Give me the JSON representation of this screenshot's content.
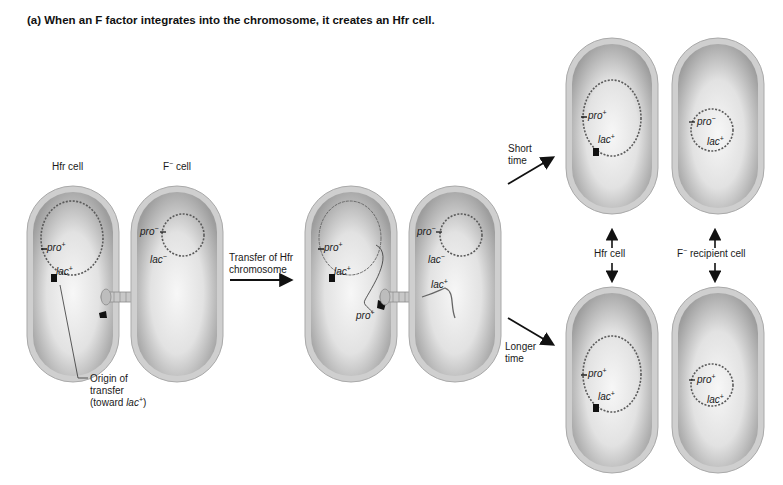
{
  "title": "(a) When an F factor integrates into the chromosome, it creates an Hfr cell.",
  "panel_left": {
    "hfr_label": "Hfr cell",
    "fminus_label": "F",
    "fminus_sup": "−",
    "fminus_suffix": " cell",
    "hfr_genes": {
      "pro": "pro",
      "pro_sup": "+",
      "lac": "lac",
      "lac_sup": "+"
    },
    "fminus_genes": {
      "pro": "pro",
      "pro_sup": "−",
      "lac": "lac",
      "lac_sup": "−"
    },
    "origin_label_line1": "Origin of",
    "origin_label_line2": "transfer",
    "origin_label_line3_prefix": "(toward ",
    "origin_label_line3_gene": "lac",
    "origin_label_line3_sup": "+",
    "origin_label_line3_suffix": ")"
  },
  "arrow_transfer": {
    "line1": "Transfer of Hfr",
    "line2": "chromosome"
  },
  "panel_middle": {
    "hfr_genes": {
      "pro": "pro",
      "pro_sup": "+",
      "lac": "lac",
      "lac_sup": "+",
      "pro2": "pro",
      "pro2_sup": "+"
    },
    "recipient_genes": {
      "pro": "pro",
      "pro_sup": "−",
      "lac": "lac",
      "lac_sup": "−",
      "lac2": "lac",
      "lac2_sup": "+"
    }
  },
  "branch_arrows": {
    "short": {
      "line1": "Short",
      "line2": "time"
    },
    "long": {
      "line1": "Longer",
      "line2": "time"
    }
  },
  "panel_right": {
    "hfr_cell_label": "Hfr cell",
    "recipient_label_prefix": "F",
    "recipient_label_sup": "−",
    "recipient_label_suffix": " recipient cell",
    "top_hfr_genes": {
      "pro": "pro",
      "pro_sup": "+",
      "lac": "lac",
      "lac_sup": "+"
    },
    "top_recipient_genes": {
      "pro": "pro",
      "pro_sup": "−",
      "lac": "lac",
      "lac_sup": "+"
    },
    "bottom_hfr_genes": {
      "pro": "pro",
      "pro_sup": "+",
      "lac": "lac",
      "lac_sup": "+"
    },
    "bottom_recipient_genes": {
      "pro": "pro",
      "pro_sup": "+",
      "lac": "lac",
      "lac_sup": "+"
    }
  },
  "colors": {
    "cell_wall": "#bdbdbd",
    "cell_inner_dark": "#9a9a9a",
    "cell_inner_light": "#f2f2f2",
    "dna": "#555555",
    "text": "#1a1a1a"
  }
}
